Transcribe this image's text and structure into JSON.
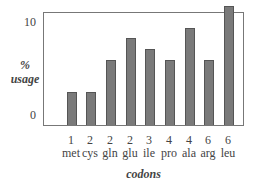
{
  "chart_data": {
    "type": "bar",
    "title": "",
    "xlabel": "codons",
    "ylabel": "% usage",
    "ylabel_lines": [
      "%",
      "usage"
    ],
    "ylim": [
      0,
      11.5
    ],
    "yticks": [
      "0",
      "10"
    ],
    "grid": false,
    "legend": null,
    "categories": [
      "met",
      "cys",
      "gln",
      "glu",
      "ile",
      "pro",
      "ala",
      "arg",
      "leu"
    ],
    "codon_counts": [
      "1",
      "2",
      "2",
      "2",
      "3",
      "4",
      "4",
      "6",
      "6"
    ],
    "values": [
      3.4,
      3.4,
      6.7,
      8.9,
      7.8,
      6.7,
      10.0,
      6.7,
      12.2
    ],
    "bar_color": "#7a7a7a"
  }
}
